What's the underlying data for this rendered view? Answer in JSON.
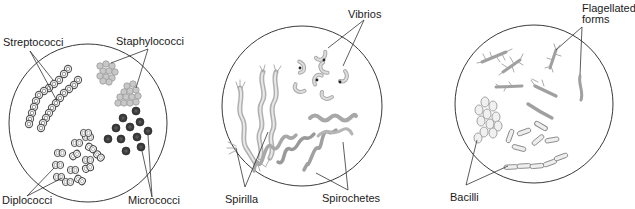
{
  "figure": {
    "panels": [
      {
        "id": "cocci",
        "labels": {
          "streptococci": "Streptococci",
          "staphylococci": "Staphylococci",
          "diplococci": "Diplococci",
          "micrococci": "Micrococci"
        }
      },
      {
        "id": "spiral",
        "labels": {
          "vibrios": "Vibrios",
          "spirilla": "Spirilla",
          "spirochetes": "Spirochetes"
        }
      },
      {
        "id": "rods",
        "labels": {
          "flagellated_line1": "Flagellated",
          "flagellated_line2": "forms",
          "bacilli": "Bacilli"
        }
      }
    ],
    "colors": {
      "outline": "#3a3a3a",
      "organism_light": "#a8a8a8",
      "organism_dark": "#2e2e2e",
      "background": "#ffffff"
    }
  }
}
